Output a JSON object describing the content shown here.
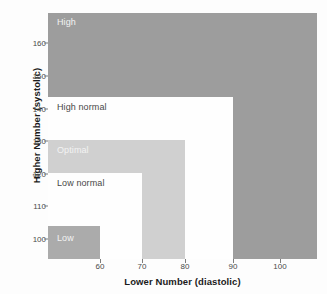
{
  "chart_data": {
    "type": "area",
    "title": "",
    "xlabel": "Lower Number (diastolic)",
    "ylabel": "Higher Number (systolic)",
    "xlim": [
      55,
      107
    ],
    "ylim": [
      93,
      165
    ],
    "xticks": [
      60,
      70,
      80,
      90,
      100
    ],
    "yticks": [
      100,
      110,
      120,
      130,
      140,
      150,
      160
    ],
    "xtick_labels": [
      "60",
      "70",
      "80",
      "90",
      "100"
    ],
    "ytick_labels": [
      "100",
      "110",
      "120",
      "130",
      "140",
      "150",
      "160"
    ],
    "grid": false,
    "legend": "none",
    "regions": [
      {
        "name": "Low",
        "label": "Low",
        "diastolic_max": 60,
        "systolic_max": 100,
        "color": "#9d9d9d",
        "label_color": "#f2f2f2"
      },
      {
        "name": "Low normal",
        "label": "Low normal",
        "diastolic_max": 70,
        "systolic_max": 110,
        "color": "#ffffff",
        "label_color": "#1d1d1d"
      },
      {
        "name": "Optimal",
        "label": "Optimal",
        "diastolic_max": 80,
        "systolic_max": 120,
        "color": "#c9c9c9",
        "label_color": "#f2f2f2"
      },
      {
        "name": "High normal",
        "label": "High normal",
        "diastolic_max": 90,
        "systolic_max": 140,
        "color": "#ffffff",
        "label_color": "#1d1d1d"
      },
      {
        "name": "High",
        "label": "High",
        "diastolic_max": null,
        "systolic_max": null,
        "color": "#8c8c8c",
        "label_color": "#f2f2f2"
      }
    ]
  },
  "axes": {
    "x": {
      "title": "Lower Number (diastolic)",
      "ticks": [
        {
          "label": "60",
          "pos": 52
        },
        {
          "label": "70",
          "pos": 94
        },
        {
          "label": "80",
          "pos": 137
        },
        {
          "label": "90",
          "pos": 185
        },
        {
          "label": "100",
          "pos": 232
        }
      ]
    },
    "y": {
      "title": "Higher Number (systolic)",
      "ticks": [
        {
          "label": "160",
          "pos": 30
        },
        {
          "label": "150",
          "pos": 63
        },
        {
          "label": "140",
          "pos": 96
        },
        {
          "label": "130",
          "pos": 128
        },
        {
          "label": "120",
          "pos": 161
        },
        {
          "label": "110",
          "pos": 193
        },
        {
          "label": "100",
          "pos": 226
        }
      ]
    }
  },
  "labels": {
    "high": "High",
    "high_normal": "High normal",
    "optimal": "Optimal",
    "low_normal": "Low normal",
    "low": "Low"
  }
}
